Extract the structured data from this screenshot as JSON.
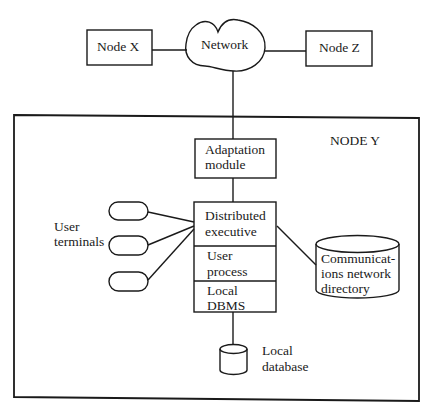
{
  "diagram": {
    "type": "distributed-system-architecture",
    "external_nodes": {
      "node_x": "Node X",
      "network": "Network",
      "node_z": "Node Z"
    },
    "node_y": {
      "title": "NODE Y",
      "adaptation_module": [
        "Adaptation",
        "module"
      ],
      "stack": {
        "distributed_executive": [
          "Distributed",
          "executive"
        ],
        "user_process": [
          "User",
          "process"
        ],
        "local_dbms": [
          "Local",
          "DBMS"
        ]
      },
      "user_terminals_label": [
        "User",
        "terminals"
      ],
      "user_terminals_count": 3,
      "comm_directory": [
        "Communicat-",
        "ions network",
        "directory"
      ],
      "local_database": [
        "Local",
        "database"
      ]
    },
    "connections": [
      {
        "from": "Node X",
        "to": "Network"
      },
      {
        "from": "Network",
        "to": "Node Z"
      },
      {
        "from": "Network",
        "to": "Adaptation module"
      },
      {
        "from": "Adaptation module",
        "to": "Distributed executive"
      },
      {
        "from": "User terminal 1",
        "to": "Distributed executive"
      },
      {
        "from": "User terminal 2",
        "to": "Distributed executive"
      },
      {
        "from": "User terminal 3",
        "to": "Distributed executive"
      },
      {
        "from": "Distributed executive",
        "to": "Communications network directory"
      },
      {
        "from": "Local DBMS",
        "to": "Local database"
      }
    ],
    "colors": {
      "line": "#1a1a1a",
      "background": "#ffffff"
    }
  }
}
